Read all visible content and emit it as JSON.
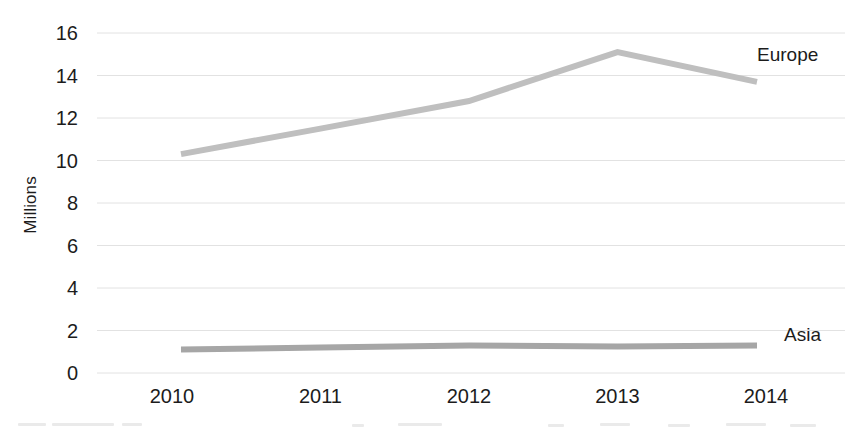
{
  "chart_data": {
    "type": "line",
    "title": "",
    "xlabel": "",
    "ylabel": "Millions",
    "categories": [
      "2010",
      "2011",
      "2012",
      "2013",
      "2014"
    ],
    "x": [
      2010,
      2011,
      2012,
      2013,
      2014
    ],
    "ylim": [
      0,
      16
    ],
    "ytick_step": 2,
    "yticks": [
      16,
      14,
      12,
      10,
      8,
      6,
      4,
      2,
      0
    ],
    "grid": "horizontal",
    "legend_position": "inline-right-of-line-end",
    "series": [
      {
        "name": "Europe",
        "color": "#bfbfbf",
        "values": [
          10.3,
          11.5,
          12.8,
          15.1,
          13.7
        ],
        "label_text": "Europe"
      },
      {
        "name": "Asia",
        "color": "#a6a6a6",
        "values": [
          1.1,
          1.2,
          1.3,
          1.25,
          1.3
        ],
        "label_text": "Asia"
      }
    ]
  },
  "axes": {
    "y_title": "Millions",
    "y_tick_labels": [
      "16",
      "14",
      "12",
      "10",
      "8",
      "6",
      "4",
      "2",
      "0"
    ],
    "x_tick_labels": [
      "2010",
      "2011",
      "2012",
      "2013",
      "2014"
    ]
  },
  "labels": {
    "europe": "Europe",
    "asia": "Asia"
  },
  "colors": {
    "europe_line": "#bfbfbf",
    "asia_line": "#a6a6a6",
    "gridline": "#e2e2e2",
    "text": "#1c1c1c",
    "background": "#ffffff"
  }
}
